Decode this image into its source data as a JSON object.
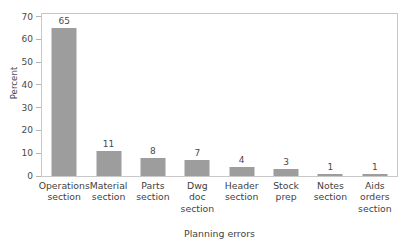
{
  "chart_data": {
    "type": "bar",
    "title": "",
    "xlabel": "Planning errors",
    "ylabel": "Percent",
    "categories": [
      "Operations section",
      "Material section",
      "Parts section",
      "Dwg doc section",
      "Header section",
      "Stock prep",
      "Notes section",
      "Aids orders section"
    ],
    "category_lines": [
      [
        "Operations",
        "section"
      ],
      [
        "Material",
        "section"
      ],
      [
        "Parts",
        "section"
      ],
      [
        "Dwg",
        "doc",
        "section"
      ],
      [
        "Header",
        "section"
      ],
      [
        "Stock",
        "prep"
      ],
      [
        "Notes",
        "section"
      ],
      [
        "Aids",
        "orders",
        "section"
      ]
    ],
    "values": [
      65,
      11,
      8,
      7,
      4,
      3,
      1,
      1
    ],
    "value_labels": [
      "65",
      "11",
      "8",
      "7",
      "4",
      "3",
      "1",
      "1"
    ],
    "ylim": [
      0,
      72
    ],
    "yticks": [
      0,
      10,
      20,
      30,
      40,
      50,
      60,
      70
    ],
    "ytick_labels": [
      "0",
      "10",
      "20",
      "30",
      "40",
      "50",
      "60",
      "70"
    ],
    "grid": false,
    "legend": null,
    "bar_color": "#9d9d9d",
    "frame_color": "#c9c9c9",
    "text_color": "#3f3f3f"
  }
}
